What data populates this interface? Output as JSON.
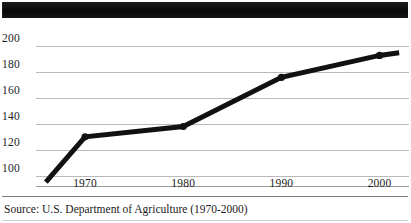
{
  "header": {
    "band_label": "redacted-title-band",
    "color": "#111111"
  },
  "caption": {
    "text": "Source:  U.S. Department of Agriculture (1970-2000)"
  },
  "chart_data": {
    "type": "line",
    "title": "",
    "subtitle": "",
    "xlabel": "",
    "ylabel": "",
    "x": [
      1966,
      1970,
      1980,
      1990,
      2000,
      2002
    ],
    "values": [
      95,
      130,
      138,
      176,
      193,
      195
    ],
    "series": [
      {
        "name": "series-1",
        "values": [
          95,
          130,
          138,
          176,
          193,
          195
        ],
        "color": "#111111"
      }
    ],
    "x_ticks": [
      1970,
      1980,
      1990,
      2000
    ],
    "x_tick_labels": [
      "1970",
      "1980",
      "1990",
      "2000"
    ],
    "y_ticks": [
      100,
      120,
      140,
      160,
      180,
      200
    ],
    "y_tick_labels": [
      "100",
      "120",
      "140",
      "160",
      "180",
      "200"
    ],
    "xlim": [
      1965,
      2003
    ],
    "ylim": [
      92,
      208
    ],
    "grid": true,
    "grid_axis": "y",
    "grid_color": "#b9b9b9",
    "legend": false,
    "legend_position": "none",
    "line_width": 5,
    "markers": true,
    "annotations": []
  }
}
